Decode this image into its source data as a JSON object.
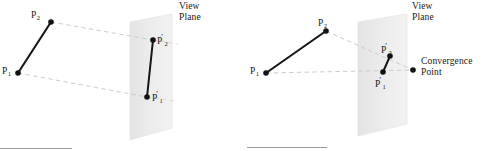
{
  "figure": {
    "background_color": "#ffffff",
    "ink_color": "#171717",
    "plane_fill_color": "#ebebeb",
    "plane_edge_color": "#d8d8d8",
    "dashed_line_color": "#c9c9c9",
    "rule_color": "#9a9a9a",
    "panels": [
      {
        "id": "left-panel",
        "name": "parallel-projection",
        "labels": {
          "view_plane": "View\nPlane",
          "view_plane_line1": "View",
          "view_plane_line2": "Plane",
          "p1": "P",
          "p1_sub": "1",
          "p2": "P",
          "p2_sub": "2",
          "p1_prime": "P",
          "p1_prime_sub": "1",
          "p2_prime": "P",
          "p2_prime_sub": "2",
          "prime_mark": "′"
        },
        "points": {
          "P1": {
            "x": 18,
            "y": 73
          },
          "P2": {
            "x": 51,
            "y": 22
          },
          "P1_prime": {
            "x": 147,
            "y": 97
          },
          "P2_prime": {
            "x": 153,
            "y": 40
          }
        },
        "plane_polygon": "130,22 172,14 172,128 130,140",
        "projector_lines": [
          {
            "from": "P2",
            "to": "P2_prime"
          },
          {
            "from": "P1",
            "to": "P1_prime"
          }
        ],
        "rule": {
          "x1": 0,
          "x2": 72,
          "y": 148
        }
      },
      {
        "id": "right-panel",
        "name": "perspective-projection",
        "labels": {
          "view_plane": "View\nPlane",
          "view_plane_line1": "View",
          "view_plane_line2": "Plane",
          "convergence_point": "Convergence\nPoint",
          "convergence_point_line1": "Convergence",
          "convergence_point_line2": "Point",
          "p1": "P",
          "p1_sub": "1",
          "p2": "P",
          "p2_sub": "2",
          "p1_prime": "P",
          "p1_prime_sub": "1",
          "p2_prime": "P",
          "p2_prime_sub": "2",
          "prime_mark": "′"
        },
        "points": {
          "P1": {
            "x": 266,
            "y": 73
          },
          "P2": {
            "x": 326,
            "y": 31
          },
          "P1_prime": {
            "x": 383,
            "y": 72
          },
          "P2_prime": {
            "x": 390,
            "y": 56
          },
          "ConvergencePoint": {
            "x": 413,
            "y": 70
          }
        },
        "plane_polygon": "358,22 407,14 407,124 358,136",
        "projector_lines": [
          {
            "from": "P2",
            "to": "ConvergencePoint"
          },
          {
            "from": "P1",
            "to": "ConvergencePoint"
          }
        ],
        "rule": {
          "x1": 247,
          "x2": 327,
          "y": 147
        }
      }
    ]
  }
}
